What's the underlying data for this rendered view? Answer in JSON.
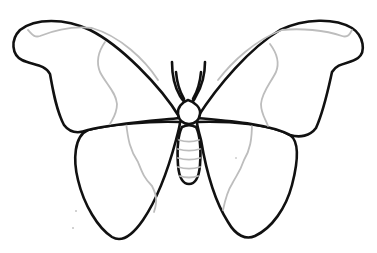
{
  "image": {
    "subject": "butterfly line drawing",
    "background_color": "#ffffff",
    "outline_color": "#111111",
    "vein_color": "#bdbdbd",
    "parts": [
      "left-forewing",
      "right-forewing",
      "left-hindwing",
      "right-hindwing",
      "head",
      "antennae",
      "abdomen"
    ],
    "abdomen_segments": 5
  }
}
